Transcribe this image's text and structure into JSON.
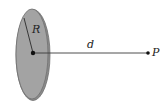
{
  "diagram": {
    "labels": {
      "radius": "R",
      "distance": "d",
      "point": "P"
    },
    "colors": {
      "disc_fill": "#a3a3a3",
      "disc_edge": "#6e6e6e",
      "disc_rim": "#8a8a8a",
      "line": "#3a3a3a",
      "dot": "#111111"
    }
  }
}
